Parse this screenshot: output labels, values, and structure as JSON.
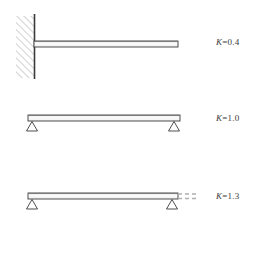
{
  "figure": {
    "background_color": "#ffffff",
    "line_color": "#3a3a3a",
    "beam_fill": "#fefefe",
    "hatch_color": "#8c8c8c",
    "dashed_color": "#b0b0b0",
    "cases": [
      {
        "id": "cantilever",
        "name": "cantilever-fixed-free",
        "k_symbol": "K",
        "k_equals": "=",
        "k_value": "0.4",
        "k_label": "K=0.4",
        "left_support": "fixed-wall-hatched",
        "right_support": "free-end",
        "has_dashed_extension": false,
        "beam": {
          "x1": 28,
          "x2": 178,
          "y": 44,
          "thickness": 6
        },
        "wall": {
          "x": 16,
          "y": 16,
          "width": 18,
          "height": 62
        }
      },
      {
        "id": "simply-supported",
        "name": "pinned-pinned",
        "k_symbol": "K",
        "k_equals": "=",
        "k_value": "1.0",
        "k_label": "K=1.0",
        "left_support": "triangle-pin",
        "right_support": "triangle-pin",
        "has_dashed_extension": false,
        "beam": {
          "x1": 28,
          "x2": 180,
          "y": 118,
          "thickness": 6
        },
        "supports": [
          {
            "x": 32,
            "y": 121
          },
          {
            "x": 174,
            "y": 121
          }
        ]
      },
      {
        "id": "simply-supported-overhang",
        "name": "pinned-pinned-with-overhang",
        "k_symbol": "K",
        "k_equals": "=",
        "k_value": "1.3",
        "k_label": "K=1.3",
        "left_support": "triangle-pin",
        "right_support": "triangle-pin",
        "has_dashed_extension": true,
        "beam": {
          "x1": 28,
          "x2": 178,
          "y": 196,
          "thickness": 6
        },
        "supports": [
          {
            "x": 32,
            "y": 199
          },
          {
            "x": 172,
            "y": 199
          }
        ],
        "dashed": {
          "x1": 178,
          "x2": 198,
          "y": 195
        }
      }
    ]
  }
}
